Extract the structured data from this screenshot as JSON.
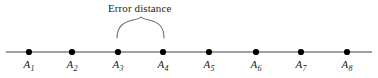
{
  "figure": {
    "width": 378,
    "height": 78,
    "background_color": "#ffffff",
    "axis_line": {
      "color": "#808080",
      "y": 52,
      "x_start": 6,
      "x_end": 372,
      "thickness": 1.4
    },
    "dot": {
      "color": "#000000",
      "radius": 3.1
    },
    "brace": {
      "color": "#6e6a6b",
      "left_x": 117,
      "right_x": 164,
      "tip_y": 38,
      "peak_x": 141,
      "peak_y": 17
    }
  },
  "annotation": {
    "label": "Error distance",
    "label_x": 108,
    "label_y": 2,
    "spans_from": "A3",
    "spans_to": "A4"
  },
  "points": [
    {
      "name": "A",
      "index": "1",
      "x": 29,
      "label_y": 58
    },
    {
      "name": "A",
      "index": "2",
      "x": 72,
      "label_y": 58
    },
    {
      "name": "A",
      "index": "3",
      "x": 118,
      "label_y": 58
    },
    {
      "name": "A",
      "index": "4",
      "x": 163,
      "label_y": 58
    },
    {
      "name": "A",
      "index": "5",
      "x": 209,
      "label_y": 58
    },
    {
      "name": "A",
      "index": "6",
      "x": 256,
      "label_y": 58
    },
    {
      "name": "A",
      "index": "7",
      "x": 301,
      "label_y": 58
    },
    {
      "name": "A",
      "index": "8",
      "x": 347,
      "label_y": 58
    }
  ]
}
